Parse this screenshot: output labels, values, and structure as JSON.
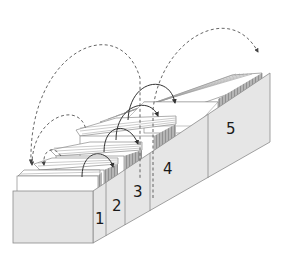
{
  "diagram": {
    "type": "leitner-box",
    "compartments": [
      {
        "id": 1,
        "label": "1"
      },
      {
        "id": 2,
        "label": "2"
      },
      {
        "id": 3,
        "label": "3"
      },
      {
        "id": 4,
        "label": "4"
      },
      {
        "id": 5,
        "label": "5"
      }
    ],
    "arrows": {
      "forward_solid": [
        "1→2",
        "2→3",
        "3→4",
        "4→5"
      ],
      "backward_dashed": [
        "2→1",
        "3→1",
        "4→1",
        "5→1"
      ]
    },
    "colors": {
      "box_face": "#e6e6e6",
      "box_edge": "#8a8a8a",
      "card_face": "#ffffff",
      "card_edge": "#777777",
      "card_stack_shade": "#9a9a9a",
      "arrow": "#333333",
      "dashed_arrow": "#555555"
    }
  }
}
